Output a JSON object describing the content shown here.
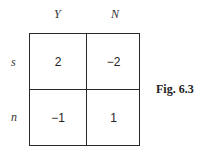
{
  "matrix": {
    "column_labels": [
      "Y",
      "N"
    ],
    "row_labels": [
      "s",
      "n"
    ],
    "cells": [
      [
        "2",
        "−2"
      ],
      [
        "−1",
        "1"
      ]
    ]
  },
  "caption": "Fig. 6.3",
  "colors": {
    "line": "#2a2a2a",
    "text": "#222222",
    "background": "#ffffff"
  }
}
